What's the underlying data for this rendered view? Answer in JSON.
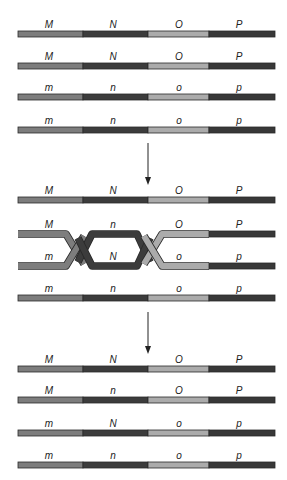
{
  "colors": {
    "M": "#7d7d7d",
    "N": "#3c3c3c",
    "O": "#ababab",
    "P": "#383838",
    "outline": "#2a2a2a",
    "arrow": "#222222",
    "background": "#ffffff"
  },
  "segments_x": [
    18,
    83,
    148,
    209,
    275
  ],
  "label_x": [
    49,
    113,
    179,
    239
  ],
  "stages": [
    {
      "name": "before",
      "rows": [
        {
          "y": 31,
          "labels": [
            "M",
            "N",
            "O",
            "P"
          ]
        },
        {
          "y": 63,
          "labels": [
            "M",
            "N",
            "O",
            "P"
          ]
        },
        {
          "y": 94,
          "labels": [
            "m",
            "n",
            "o",
            "p"
          ]
        },
        {
          "y": 127,
          "labels": [
            "m",
            "n",
            "o",
            "p"
          ]
        }
      ]
    },
    {
      "name": "crossing-over",
      "rows": [
        {
          "y": 197,
          "labels": [
            "M",
            "N",
            "O",
            "P"
          ]
        },
        {
          "y": 231,
          "labels": [
            "M",
            "n",
            "O",
            "P"
          ],
          "crossover": true
        },
        {
          "y": 263,
          "labels": [
            "m",
            "N",
            "o",
            "p"
          ],
          "crossover": true
        },
        {
          "y": 295,
          "labels": [
            "m",
            "n",
            "o",
            "p"
          ]
        }
      ]
    },
    {
      "name": "after",
      "rows": [
        {
          "y": 366,
          "labels": [
            "M",
            "N",
            "O",
            "P"
          ]
        },
        {
          "y": 397,
          "labels": [
            "M",
            "n",
            "O",
            "P"
          ]
        },
        {
          "y": 430,
          "labels": [
            "m",
            "N",
            "o",
            "p"
          ]
        },
        {
          "y": 462,
          "labels": [
            "m",
            "n",
            "o",
            "p"
          ]
        }
      ]
    }
  ],
  "arrows": [
    {
      "x": 148,
      "y1": 143,
      "y2": 185
    },
    {
      "x": 148,
      "y1": 312,
      "y2": 354
    }
  ]
}
